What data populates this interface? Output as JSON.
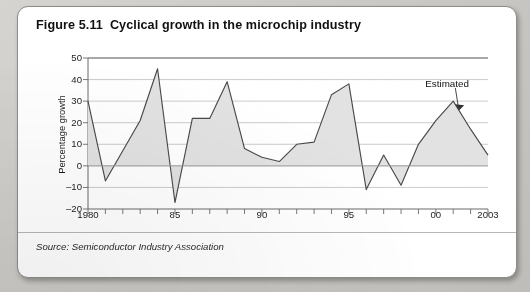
{
  "figure": {
    "number": "Figure 5.11",
    "title": "Cyclical growth in the microchip industry",
    "source": "Source: Semiconductor Industry Association"
  },
  "chart_data": {
    "type": "area",
    "title": "Cyclical growth in the microchip industry",
    "xlabel": "",
    "ylabel": "Percentage growth",
    "ylim": [
      -20,
      50
    ],
    "xlim": [
      1980,
      2003
    ],
    "grid": true,
    "legend_position": "none",
    "yticks": [
      50,
      40,
      30,
      20,
      10,
      0,
      -10,
      -20
    ],
    "xticks": [
      1980,
      1985,
      1990,
      1995,
      2000,
      2003
    ],
    "xtick_labels": [
      "1980",
      "85",
      "90",
      "95",
      "00",
      "2003"
    ],
    "annotations": [
      {
        "text": "Estimated",
        "x": 2001,
        "y": 30,
        "label_x": 2000.2,
        "label_y": 38
      }
    ],
    "series": [
      {
        "name": "Percentage growth",
        "line_color": "#4a4a4a",
        "fill_color": "#e2e2e2",
        "x": [
          1980,
          1981,
          1982,
          1983,
          1984,
          1985,
          1986,
          1987,
          1988,
          1989,
          1990,
          1991,
          1992,
          1993,
          1994,
          1995,
          1996,
          1997,
          1998,
          1999,
          2000,
          2001,
          2002,
          2003
        ],
        "values": [
          30,
          -7,
          7,
          21,
          45,
          -17,
          22,
          22,
          39,
          8,
          4,
          2,
          10,
          11,
          33,
          38,
          -11,
          5,
          -9,
          10,
          21,
          30,
          17,
          5
        ]
      }
    ]
  }
}
